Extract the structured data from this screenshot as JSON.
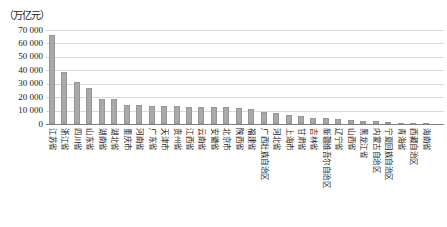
{
  "chart_data": {
    "type": "bar",
    "title": "",
    "unit_label": "（万亿元）",
    "xlabel": "",
    "ylabel": "万亿元",
    "ylim": [
      0,
      70000
    ],
    "ytick_interval": 10000,
    "ytick_labels": [
      "70 000",
      "60 000",
      "50 000",
      "40 000",
      "30 000",
      "20 000",
      "10 000",
      "0"
    ],
    "grid": true,
    "legend": "none",
    "categories": [
      "江苏省",
      "浙江省",
      "四川省",
      "山东省",
      "湖南省",
      "湖北省",
      "重庆市",
      "河南省",
      "广东省",
      "天津市",
      "贵州省",
      "江西省",
      "云南省",
      "安徽省",
      "北京市",
      "陕西省",
      "福建省",
      "广西壮族自治区",
      "河北省",
      "上海市",
      "甘肃省",
      "吉林省",
      "新疆维吾尔自治区",
      "辽宁省",
      "山西省",
      "黑龙江省",
      "内蒙古自治区",
      "宁夏回族自治区",
      "青海省",
      "西藏自治区",
      "海南省"
    ],
    "values": [
      66000,
      39000,
      31500,
      27000,
      18800,
      18600,
      14000,
      13800,
      13600,
      13400,
      13200,
      13000,
      12900,
      12700,
      12500,
      11800,
      10800,
      9300,
      8000,
      7000,
      5600,
      4500,
      4100,
      3400,
      2900,
      2500,
      2000,
      1600,
      1100,
      600,
      300
    ],
    "colors": {
      "bar_fill": "#a9a9a9",
      "bar_border": "#969696",
      "gridline": "#d9d9d9",
      "axis_line": "#7f7f7f",
      "text": "#1a1a1a"
    }
  }
}
